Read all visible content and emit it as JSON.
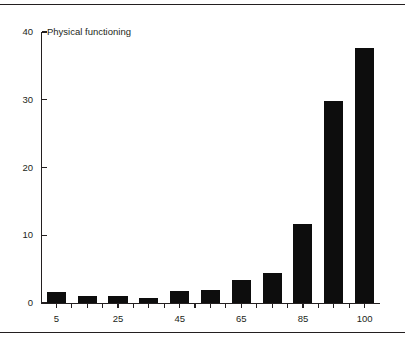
{
  "chart_data": {
    "type": "bar",
    "title": "Physical functioning",
    "xlabel": "",
    "ylabel": "",
    "grid": false,
    "legend": "none",
    "categories": [
      "5",
      "15",
      "25",
      "35",
      "45",
      "55",
      "65",
      "75",
      "85",
      "95",
      "100"
    ],
    "values": [
      1.6,
      1.1,
      1.1,
      0.8,
      1.8,
      1.9,
      3.4,
      4.5,
      11.6,
      29.8,
      37.7
    ],
    "x_tick_labels": [
      "5",
      "25",
      "45",
      "65",
      "85",
      "100"
    ],
    "x_tick_label_indices": [
      0,
      2,
      4,
      6,
      8,
      10
    ],
    "y_tick_labels": [
      "0",
      "10",
      "20",
      "30",
      "40"
    ],
    "y_tick_values": [
      0,
      10,
      20,
      30,
      40
    ],
    "ylim": [
      0,
      40
    ],
    "bar_color": "#0d0d0d",
    "axis_color": "#231f20",
    "background_color": "#ffffff"
  }
}
